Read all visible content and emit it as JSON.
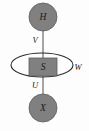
{
  "figure": {
    "name": "hidden-state-observation-diagram",
    "background_color": "#fdfdfd",
    "width": 89,
    "height": 131
  },
  "style": {
    "node_fill": "#808080",
    "node_stroke": "#5c5c5c",
    "edge_color": "#8c8c8c",
    "loop_color": "#2b2b2b",
    "label_color": "#1a1a1a"
  },
  "nodes": [
    {
      "id": "H",
      "label": "H",
      "shape": "circle",
      "cx": 43,
      "cy": 17,
      "r": 14,
      "fill": "#808080"
    },
    {
      "id": "S",
      "label": "S",
      "shape": "rect",
      "cx": 43,
      "cy": 67,
      "width": 28,
      "height": 18,
      "fill": "#808080"
    },
    {
      "id": "X",
      "label": "X",
      "shape": "circle",
      "cx": 43,
      "cy": 108,
      "r": 14,
      "fill": "#808080"
    }
  ],
  "edges": [
    {
      "id": "V",
      "label": "V",
      "from": "H",
      "to": "S",
      "label_x": 35,
      "label_y": 41
    },
    {
      "id": "U",
      "label": "U",
      "from": "S",
      "to": "X",
      "label_x": 35,
      "label_y": 86
    }
  ],
  "self_loop": {
    "id": "W",
    "label": "W",
    "on_node": "S",
    "cx": 42,
    "cy": 65,
    "rx": 31,
    "ry": 12,
    "label_x": 77,
    "label_y": 68
  }
}
